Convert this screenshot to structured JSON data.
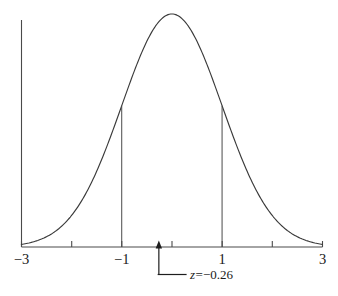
{
  "figure": {
    "name": "standard-normal-distribution-curve",
    "background_color": "#ffffff",
    "curve_color": "#3a3a3a",
    "axis_color": "#4a4a4a",
    "annotation_color": "#1d1d1d"
  },
  "axis": {
    "x_min": -3,
    "x_max": 3,
    "tick_values": [
      -3,
      -2,
      -1,
      0,
      1,
      2,
      3
    ],
    "labeled_ticks": [
      {
        "value": -3,
        "label": "−3"
      },
      {
        "value": -1,
        "label": "−1"
      },
      {
        "value": 1,
        "label": "1"
      },
      {
        "value": 3,
        "label": "3"
      }
    ],
    "y_axis_at": -3
  },
  "ordinates": [
    {
      "name": "ordinate-minus-one",
      "z": -1
    },
    {
      "name": "ordinate-plus-one",
      "z": 1
    }
  ],
  "annotation": {
    "z_value": -0.26,
    "label_prefix": "z",
    "label_equals": "=",
    "label_value": "−0.26",
    "full_label": "z=−0.26"
  },
  "chart_data": {
    "type": "line",
    "title": "",
    "xlabel": "",
    "ylabel": "",
    "xlim": [
      -3,
      3
    ],
    "ylim": [
      0,
      0.4
    ],
    "grid": false,
    "legend": null,
    "series": [
      {
        "name": "standard normal density",
        "formula": "phi(x) = exp(-x^2/2)/sqrt(2*pi)",
        "x": [
          -3,
          -2.75,
          -2.5,
          -2.25,
          -2,
          -1.75,
          -1.5,
          -1.25,
          -1,
          -0.75,
          -0.5,
          -0.25,
          0,
          0.25,
          0.5,
          0.75,
          1,
          1.25,
          1.5,
          1.75,
          2,
          2.25,
          2.5,
          2.75,
          3
        ],
        "y": [
          0.0044,
          0.0091,
          0.0175,
          0.0317,
          0.054,
          0.0863,
          0.1295,
          0.1826,
          0.242,
          0.3011,
          0.3521,
          0.3867,
          0.3989,
          0.3867,
          0.3521,
          0.3011,
          0.242,
          0.1826,
          0.1295,
          0.0863,
          0.054,
          0.0317,
          0.0175,
          0.0091,
          0.0044
        ]
      }
    ],
    "annotations": [
      {
        "type": "vertical-line",
        "x": -1,
        "y_from": 0,
        "y_to": 0.242
      },
      {
        "type": "vertical-line",
        "x": 1,
        "y_from": 0,
        "y_to": 0.242
      },
      {
        "type": "arrow-marker",
        "x": -0.26,
        "text": "z=−0.26"
      }
    ],
    "tick_labels": {
      "x": [
        "−3",
        "−1",
        "1",
        "3"
      ]
    }
  }
}
